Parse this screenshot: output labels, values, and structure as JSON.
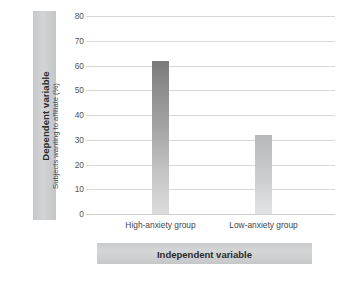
{
  "banners": {
    "dependent": "Dependent variable",
    "independent": "Independent variable"
  },
  "chart_data": {
    "type": "bar",
    "title": "",
    "subtitle": "",
    "xlabel": "Independent variable",
    "ylabel": "Subjects wanting to affiliate (%)",
    "categories": [
      "High-anxiety group",
      "Low-anxiety group"
    ],
    "values": [
      62,
      32
    ],
    "ylim": [
      0,
      80
    ],
    "yticks": [
      0,
      10,
      20,
      30,
      40,
      50,
      60,
      70,
      80
    ],
    "ytick_labels": [
      "0",
      "10",
      "20",
      "30",
      "40",
      "50",
      "60",
      "70",
      "80"
    ],
    "grid": true,
    "legend": false,
    "legend_position": "none",
    "bar_colors": [
      "#8d8d8d",
      "#c6c8ca"
    ],
    "background_color": "#ffffff",
    "gridline_color": "#d8d8d8",
    "annotations": []
  }
}
